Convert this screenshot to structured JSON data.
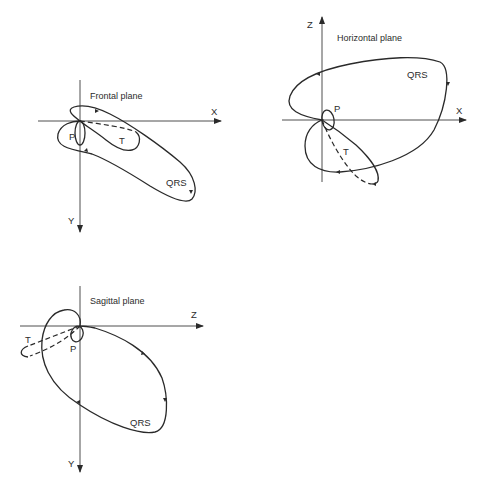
{
  "diagram": {
    "type": "vectorcardiogram-loops",
    "panels": [
      {
        "id": "frontal",
        "title": "Frontal plane",
        "axes": {
          "horizontal": "X",
          "vertical": "Y"
        },
        "loops": {
          "qrs": "QRS",
          "t": "T",
          "p": "P"
        }
      },
      {
        "id": "horizontal",
        "title": "Horizontal plane",
        "axes": {
          "horizontal": "X",
          "vertical": "Z"
        },
        "loops": {
          "qrs": "QRS",
          "t": "T",
          "p": "P"
        }
      },
      {
        "id": "sagittal",
        "title": "Sagittal plane",
        "axes": {
          "horizontal": "Z",
          "vertical": "Y"
        },
        "loops": {
          "qrs": "QRS",
          "t": "T",
          "p": "P"
        }
      }
    ],
    "colors": {
      "line": "#2a2a2a",
      "background": "#ffffff"
    }
  }
}
